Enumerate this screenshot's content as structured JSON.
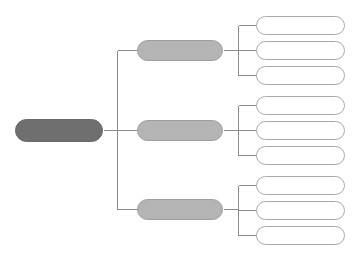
{
  "document": {
    "type": "hierarchy-tree-diagram",
    "title": "",
    "title_visible": false,
    "orientation": "left-to-right",
    "levels": 3,
    "background_color": "#ffffff"
  },
  "palette": {
    "root_fill": "#6f6f6f",
    "root_border": "#6a6a6a",
    "root_text": "#ffffff",
    "branch_fill": "#b4b4b4",
    "branch_border": "#9e9e9e",
    "branch_text": "#404040",
    "leaf_fill": "#ffffff",
    "leaf_border": "#a9a9a9",
    "leaf_text": "#555555",
    "connector": "#8c8c8c",
    "title_text": "#d8d8d8"
  },
  "root": {
    "label": "",
    "shape": "rounded-rectangle"
  },
  "branches": [
    {
      "label": "",
      "leaves": [
        {
          "label": ""
        },
        {
          "label": ""
        },
        {
          "label": ""
        }
      ]
    },
    {
      "label": "",
      "leaves": [
        {
          "label": ""
        },
        {
          "label": ""
        },
        {
          "label": ""
        }
      ]
    },
    {
      "label": "",
      "leaves": [
        {
          "label": ""
        },
        {
          "label": ""
        },
        {
          "label": ""
        }
      ]
    }
  ]
}
